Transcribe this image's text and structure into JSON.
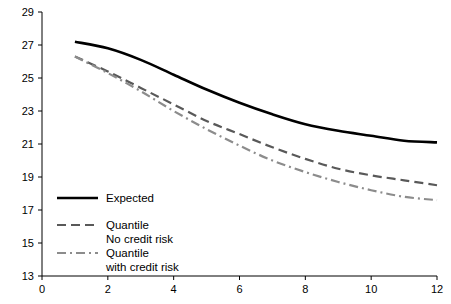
{
  "chart_data": {
    "type": "line",
    "title": "",
    "xlabel": "",
    "ylabel": "",
    "xlim": [
      0,
      12
    ],
    "ylim": [
      13,
      29
    ],
    "grid": false,
    "legend_position": "lower-left",
    "x_ticks": [
      "0",
      "2",
      "4",
      "6",
      "8",
      "10",
      "12"
    ],
    "y_ticks": [
      "13",
      "15",
      "17",
      "19",
      "21",
      "23",
      "25",
      "27",
      "29"
    ],
    "x": [
      1,
      2,
      3,
      4,
      5,
      6,
      7,
      8,
      9,
      10,
      11,
      12
    ],
    "series": [
      {
        "name": "Expected",
        "style": "solid",
        "color": "#000000",
        "values": [
          27.2,
          26.8,
          26.1,
          25.2,
          24.3,
          23.5,
          22.8,
          22.2,
          21.8,
          21.5,
          21.2,
          21.1
        ]
      },
      {
        "name": "Quantile\nNo credit risk",
        "label_line1": "Quantile",
        "label_line2": "No credit risk",
        "style": "dashed",
        "color": "#595959",
        "values": [
          26.3,
          25.4,
          24.4,
          23.4,
          22.4,
          21.6,
          20.8,
          20.1,
          19.5,
          19.1,
          18.8,
          18.5
        ]
      },
      {
        "name": "Quantile\nwith credit risk",
        "label_line1": "Quantile",
        "label_line2": "with credit risk",
        "style": "dash-dot",
        "color": "#8c8c8c",
        "values": [
          26.3,
          25.3,
          24.2,
          23.0,
          21.9,
          20.9,
          20.0,
          19.3,
          18.7,
          18.2,
          17.8,
          17.6
        ]
      }
    ]
  },
  "axis": {
    "x_tick_values": [
      0,
      2,
      4,
      6,
      8,
      10,
      12
    ],
    "y_tick_values": [
      13,
      15,
      17,
      19,
      21,
      23,
      25,
      27,
      29
    ]
  }
}
